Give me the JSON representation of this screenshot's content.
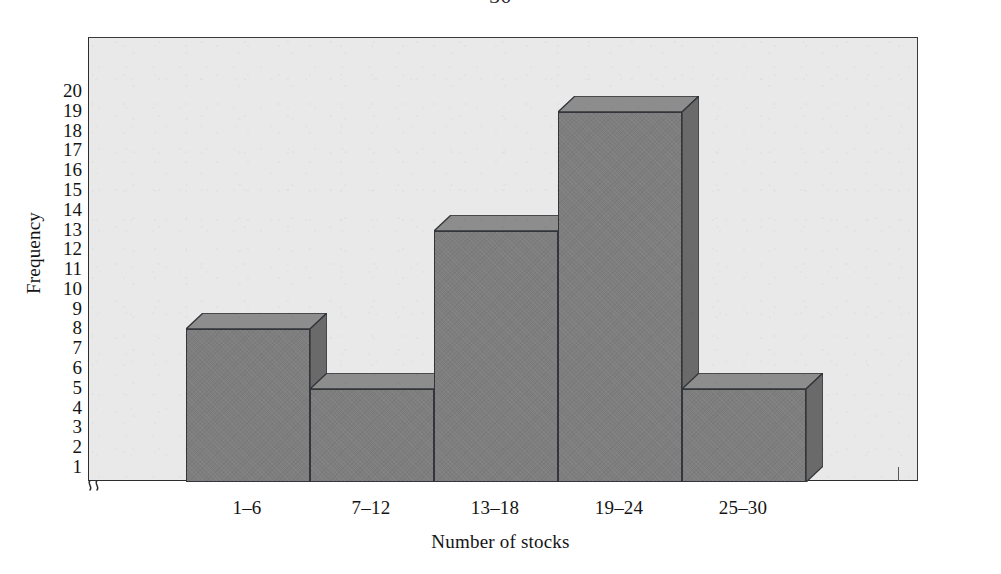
{
  "page": {
    "number": "50"
  },
  "chart_data": {
    "type": "bar",
    "title": "",
    "subtitle": "",
    "xlabel": "Number of stocks",
    "ylabel": "Frequency",
    "categories": [
      "1–6",
      "7–12",
      "13–18",
      "19–24",
      "25–30"
    ],
    "values": [
      8,
      5,
      13,
      19,
      5
    ],
    "ylim": [
      0,
      20
    ],
    "ytick_labels": [
      "20",
      "19",
      "18",
      "17",
      "16",
      "15",
      "14",
      "13",
      "12",
      "11",
      "10",
      "9",
      "8",
      "7",
      "6",
      "5",
      "4",
      "3",
      "2",
      "1"
    ],
    "ytick_values": [
      20,
      19,
      18,
      17,
      16,
      15,
      14,
      13,
      12,
      11,
      10,
      9,
      8,
      7,
      6,
      5,
      4,
      3,
      2,
      1
    ],
    "grid": false,
    "legend": null,
    "legend_position": "none",
    "style": "3d-histogram",
    "axis_break": "≈",
    "bars_adjacent": true,
    "annotations": []
  },
  "colors": {
    "bar_front": "#7e7e7e",
    "bar_top": "#8d8d8d",
    "bar_side": "#6a6a6a",
    "bar_outline": "#32353a",
    "plot_background": "#e9e9e9",
    "axis_line": "#2d2d2d",
    "text": "#141414",
    "page_background": "#ffffff"
  }
}
